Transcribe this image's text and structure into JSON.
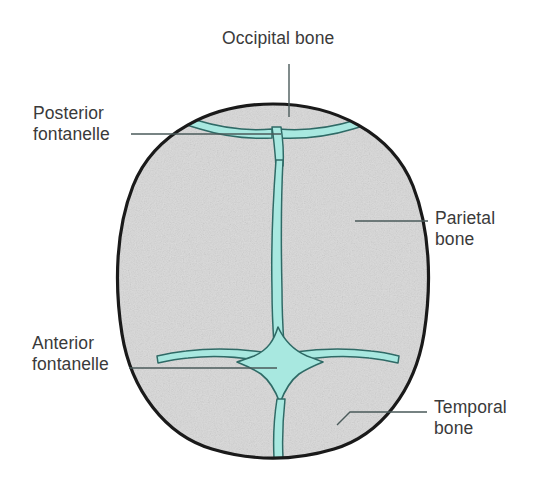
{
  "figure": {
    "view": "superior (top-down) view of an infant cranium",
    "background_color": "#ffffff",
    "bone_fill_color": "#dcdcdc",
    "bone_outline_color": "#1a1a1a",
    "fontanelle_fill_color": "#a8e8e0",
    "suture_outline_color": "#2f6a66",
    "leader_line_color": "#4a5a5a",
    "label_text_color": "#3a3a3a"
  },
  "labels": {
    "occipital": {
      "text": "Occipital bone",
      "position": "top-center",
      "points_to": "posterior skull margin"
    },
    "posterior_fontanelle": {
      "text": "Posterior\nfontanelle",
      "position": "upper-left",
      "points_to": "small triangular fontanelle at junction of sagittal and lambdoid sutures"
    },
    "parietal": {
      "text": "Parietal\nbone",
      "position": "right",
      "points_to": "right parietal bone plate"
    },
    "anterior_fontanelle": {
      "text": "Anterior\nfontanelle",
      "position": "lower-left",
      "points_to": "large diamond-shaped fontanelle at junction of sagittal, coronal and metopic sutures"
    },
    "temporal": {
      "text": "Temporal\nbone",
      "position": "lower-right",
      "points_to": "right anterolateral skull margin"
    }
  },
  "structures": [
    {
      "name": "occipital-bone",
      "type": "bone",
      "fill": "#dcdcdc"
    },
    {
      "name": "parietal-bone-left",
      "type": "bone",
      "fill": "#dcdcdc"
    },
    {
      "name": "parietal-bone-right",
      "type": "bone",
      "fill": "#dcdcdc"
    },
    {
      "name": "frontal-bone-left",
      "type": "bone",
      "fill": "#dcdcdc"
    },
    {
      "name": "frontal-bone-right",
      "type": "bone",
      "fill": "#dcdcdc"
    },
    {
      "name": "anterior-fontanelle",
      "type": "fontanelle",
      "shape": "diamond",
      "fill": "#a8e8e0"
    },
    {
      "name": "posterior-fontanelle",
      "type": "fontanelle",
      "shape": "triangle",
      "fill": "#a8e8e0"
    },
    {
      "name": "sagittal-suture",
      "type": "suture",
      "fill": "#a8e8e0"
    },
    {
      "name": "coronal-suture-left",
      "type": "suture",
      "fill": "#a8e8e0"
    },
    {
      "name": "coronal-suture-right",
      "type": "suture",
      "fill": "#a8e8e0"
    },
    {
      "name": "lambdoid-suture-left",
      "type": "suture",
      "fill": "#a8e8e0"
    },
    {
      "name": "lambdoid-suture-right",
      "type": "suture",
      "fill": "#a8e8e0"
    },
    {
      "name": "metopic-suture",
      "type": "suture",
      "fill": "#a8e8e0"
    }
  ]
}
